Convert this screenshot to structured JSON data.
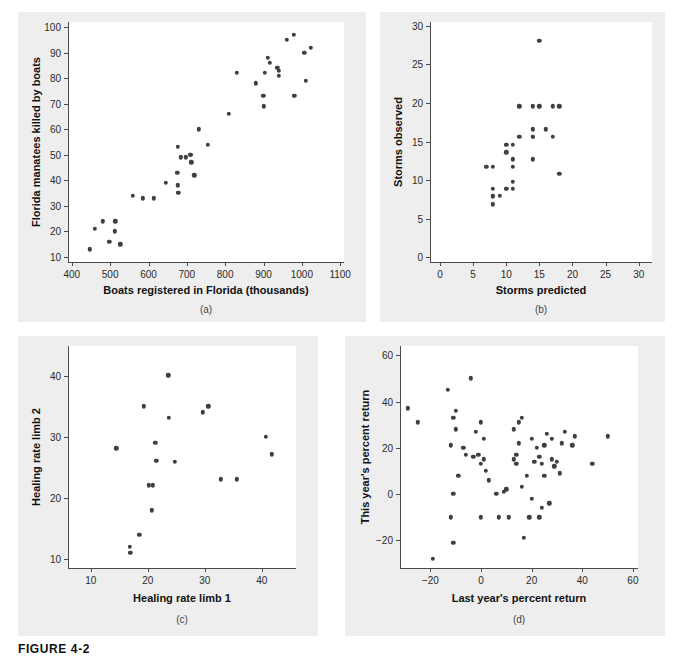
{
  "figure": {
    "caption": "FIGURE 4-2",
    "background": "#ffffff",
    "panel_background": "#eeeeee",
    "dot_color": "#3f3f3f",
    "axis_color": "#4a4a4a"
  },
  "chart_data": [
    {
      "id": "a",
      "type": "scatter",
      "panel_label": "(a)",
      "title": "",
      "xlabel": "Boats registered in Florida (thousands)",
      "ylabel": "Florida manatees killed by boats",
      "xlim": [
        390,
        1110
      ],
      "ylim": [
        8,
        102
      ],
      "xticks": [
        400,
        500,
        600,
        700,
        800,
        900,
        1000,
        1100
      ],
      "yticks": [
        10,
        20,
        30,
        40,
        50,
        60,
        70,
        80,
        90,
        100
      ],
      "grid": false,
      "legend": "none",
      "x": [
        447,
        460,
        481,
        498,
        513,
        512,
        526,
        559,
        585,
        614,
        645,
        675,
        676,
        677,
        678,
        684,
        697,
        709,
        711,
        712,
        719,
        731,
        755,
        809,
        830,
        880,
        899,
        900,
        903,
        912,
        916,
        936,
        940,
        940,
        961,
        979,
        980,
        1006,
        1010,
        1024
      ],
      "y": [
        13,
        21,
        24,
        16,
        24,
        20,
        15,
        34,
        33,
        33,
        39,
        43,
        53,
        38,
        35,
        49,
        49,
        50,
        50,
        47,
        42,
        60,
        54,
        66,
        82,
        78,
        73,
        69,
        82,
        88,
        86,
        84,
        83,
        81,
        95,
        97,
        73,
        90,
        79,
        92
      ]
    },
    {
      "id": "b",
      "type": "scatter",
      "panel_label": "(b)",
      "title": "",
      "xlabel": "Storms predicted",
      "ylabel": "Storms observed",
      "xlim": [
        -1.5,
        32
      ],
      "ylim": [
        -0.6,
        30.5
      ],
      "xticks": [
        0,
        5,
        10,
        15,
        20,
        25,
        30
      ],
      "yticks": [
        0,
        5,
        10,
        15,
        20,
        25,
        30
      ],
      "grid": false,
      "legend": "none",
      "x": [
        7,
        8,
        8,
        8,
        8,
        8,
        9,
        10,
        10,
        10,
        11,
        11,
        11,
        11,
        11,
        12,
        12,
        14,
        14,
        14,
        14,
        14,
        15,
        15,
        16,
        17,
        17,
        18,
        18
      ],
      "y": [
        11.7,
        11.7,
        8.9,
        8.0,
        7.9,
        6.9,
        8.0,
        14.6,
        13.6,
        8.9,
        14.6,
        12.7,
        11.7,
        9.8,
        8.9,
        19.6,
        15.6,
        19.6,
        16.6,
        15.6,
        12.7,
        15.6,
        28.1,
        19.6,
        16.6,
        19.6,
        15.6,
        10.8,
        19.6
      ]
    },
    {
      "id": "c",
      "type": "scatter",
      "panel_label": "(c)",
      "title": "",
      "xlabel": "Healing rate limb 1",
      "ylabel": "Healing rate limb 2",
      "xlim": [
        6,
        46
      ],
      "ylim": [
        8.5,
        45
      ],
      "xticks": [
        10,
        20,
        30,
        40
      ],
      "yticks": [
        10,
        20,
        30,
        40
      ],
      "grid": false,
      "legend": "none",
      "x": [
        14.5,
        16.8,
        16.9,
        18.5,
        19.3,
        20.2,
        20.9,
        20.7,
        21.3,
        21.5,
        23.6,
        23.7,
        24.7,
        29.7,
        30.6,
        32.8,
        35.6,
        40.7,
        41.8
      ],
      "y": [
        28.2,
        12.0,
        11.0,
        14.0,
        35.1,
        22.1,
        22.1,
        18.0,
        29.1,
        26.1,
        40.2,
        33.2,
        26.0,
        34.1,
        35.1,
        23.1,
        23.1,
        30.1,
        27.2
      ]
    },
    {
      "id": "d",
      "type": "scatter",
      "panel_label": "(d)",
      "title": "",
      "xlabel": "Last year's percent return",
      "ylabel": "This year's percent return",
      "xlim": [
        -32,
        62
      ],
      "ylim": [
        -32,
        64
      ],
      "xticks": [
        -20,
        0,
        20,
        40,
        60
      ],
      "yticks": [
        -20,
        0,
        20,
        40,
        60
      ],
      "grid": false,
      "legend": "none",
      "x": [
        -29,
        -25,
        -19,
        -13,
        -12,
        -12,
        -11,
        -11,
        -11,
        -10,
        -10,
        -9,
        -7,
        -6,
        -4,
        -3,
        -2,
        -1,
        0,
        0,
        0,
        1,
        1,
        2,
        3,
        6,
        7,
        9,
        10,
        11,
        13,
        13,
        14,
        14,
        15,
        15,
        16,
        16,
        17,
        18,
        19,
        20,
        20,
        21,
        22,
        23,
        23,
        24,
        24,
        25,
        25,
        26,
        27,
        28,
        28,
        29,
        30,
        31,
        32,
        33,
        36,
        37,
        44,
        50
      ],
      "y": [
        37,
        31,
        -28,
        45,
        21,
        -10,
        33,
        0,
        -21,
        28,
        36,
        8,
        20,
        17,
        50,
        16,
        27,
        17,
        31,
        13,
        -10,
        24,
        15,
        10,
        6,
        0,
        -10,
        1,
        2,
        -10,
        28,
        15,
        17,
        13,
        22,
        31,
        33,
        3,
        -19,
        8,
        -10,
        24,
        -2,
        14,
        20,
        16,
        -10,
        13,
        -6,
        21,
        8,
        26,
        -4,
        15,
        24,
        12,
        14,
        9,
        22,
        27,
        21,
        25,
        13,
        25
      ]
    }
  ]
}
